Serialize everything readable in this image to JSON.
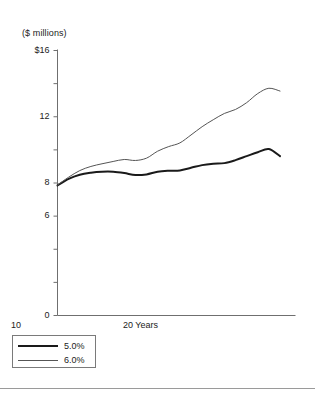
{
  "chart_data": {
    "type": "line",
    "title": "($ millions)",
    "xlabel": "Years",
    "ylabel": "($ millions)",
    "xlim": [
      0,
      20
    ],
    "ylim": [
      0,
      16
    ],
    "grid": false,
    "legend_position": "below-left",
    "y_ticks": [
      0,
      2,
      4,
      6,
      8,
      10,
      12,
      14,
      16
    ],
    "y_tick_labels": [
      "0",
      "",
      "",
      "6",
      "8",
      "",
      "12",
      "",
      "$16"
    ],
    "x_ticks": [
      10,
      20
    ],
    "x_tick_labels": [
      "10",
      "20 Years"
    ],
    "x": [
      0,
      1,
      2,
      3,
      4,
      5,
      6,
      7,
      8,
      9,
      10,
      11,
      12,
      13,
      14,
      15,
      16,
      17,
      18,
      19,
      20
    ],
    "series": [
      {
        "name": "5.0%",
        "style": "thick",
        "color": "#1a1a1a",
        "values": [
          7.85,
          8.25,
          8.5,
          8.62,
          8.68,
          8.68,
          8.6,
          8.48,
          8.52,
          8.68,
          8.74,
          8.76,
          8.92,
          9.08,
          9.16,
          9.2,
          9.38,
          9.62,
          9.86,
          10.05,
          9.62
        ]
      },
      {
        "name": "6.0%",
        "style": "thin",
        "color": "#555555",
        "values": [
          7.88,
          8.35,
          8.75,
          9.0,
          9.16,
          9.3,
          9.42,
          9.36,
          9.5,
          9.92,
          10.2,
          10.42,
          10.9,
          11.4,
          11.82,
          12.2,
          12.44,
          12.85,
          13.4,
          13.72,
          13.55
        ]
      }
    ]
  },
  "axis_title": "($ millions)",
  "legend": {
    "entries": [
      {
        "label": "5.0%"
      },
      {
        "label": "6.0%"
      }
    ]
  }
}
